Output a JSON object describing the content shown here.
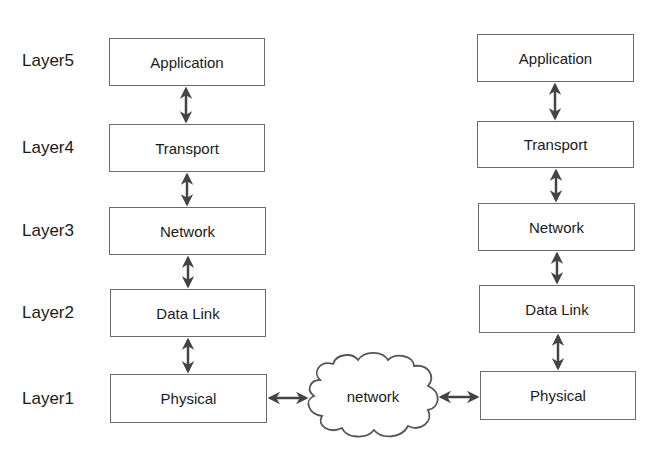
{
  "layer_labels": [
    {
      "text": "Layer5",
      "top": 51
    },
    {
      "text": "Layer4",
      "top": 138
    },
    {
      "text": "Layer3",
      "top": 221
    },
    {
      "text": "Layer2",
      "top": 303
    },
    {
      "text": "Layer1",
      "top": 389
    }
  ],
  "left_stack": [
    {
      "label": "Application",
      "top": 38,
      "height": 48
    },
    {
      "label": "Transport",
      "top": 124,
      "height": 48
    },
    {
      "label": "Network",
      "top": 207,
      "height": 48
    },
    {
      "label": "Data Link",
      "top": 289,
      "height": 48
    },
    {
      "label": "Physical",
      "top": 374,
      "height": 49
    }
  ],
  "right_stack": [
    {
      "label": "Application",
      "top": 34,
      "height": 48
    },
    {
      "label": "Transport",
      "top": 121,
      "height": 47
    },
    {
      "label": "Network",
      "top": 203,
      "height": 48
    },
    {
      "label": "Data Link",
      "top": 285,
      "height": 48
    },
    {
      "label": "Physical",
      "top": 371,
      "height": 49
    }
  ],
  "cloud": {
    "label": "network"
  },
  "colors": {
    "box_border": "#6b6b6b",
    "arrow": "#444444",
    "cloud_stroke": "#555555"
  }
}
